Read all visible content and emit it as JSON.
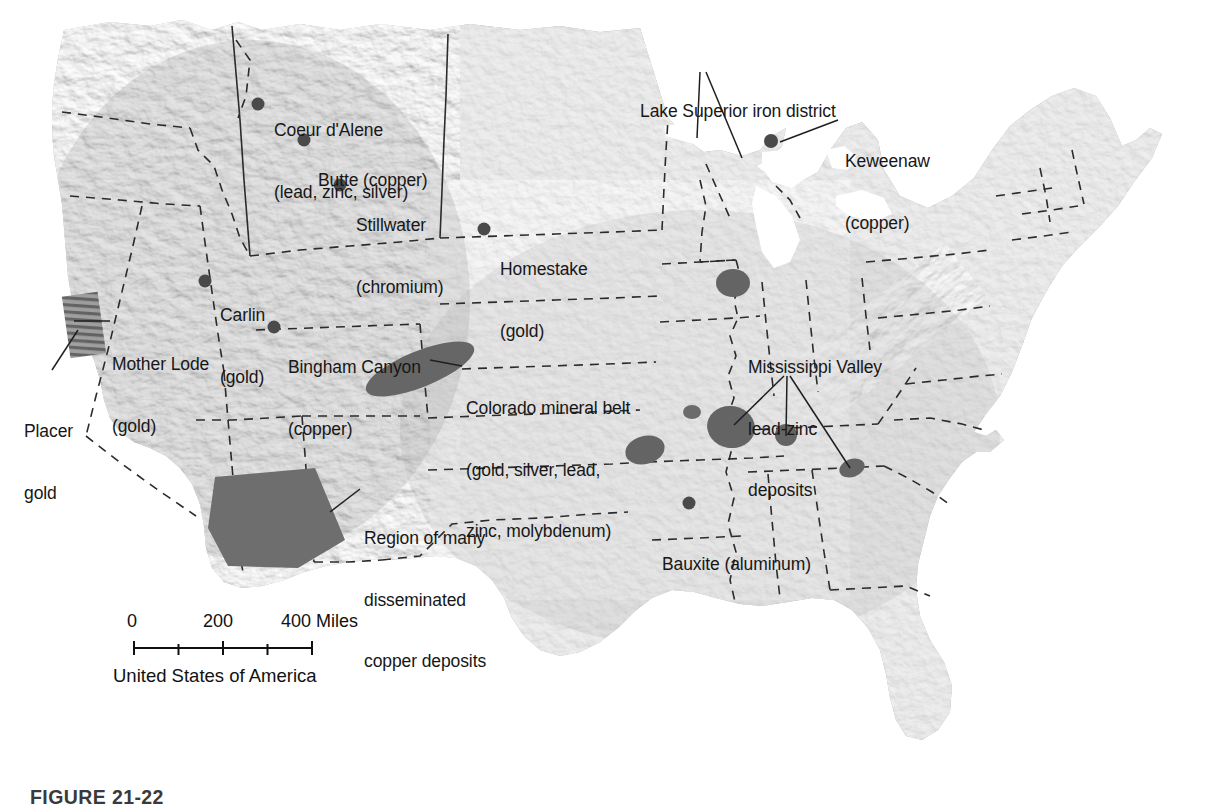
{
  "figure": {
    "caption": "FIGURE 21-22",
    "map_title": "United States of America"
  },
  "colors": {
    "land": "#9b9b9b",
    "land_light": "#b4b4b4",
    "land_dark": "#808080",
    "ore_blob": "#5f5f5f",
    "ore_region": "#6a6a6a",
    "border_dash": "#2b2b2b",
    "text": "#171717",
    "water": "#ffffff",
    "leader": "#1f1f1f"
  },
  "scale_bar": {
    "labels": [
      "0",
      "200",
      "400 Miles"
    ],
    "ticks": [
      0,
      100,
      200,
      300,
      400
    ],
    "unit": "Miles",
    "max_value": 400
  },
  "point_deposits": [
    {
      "name": "Coeur d'Alene",
      "line1": "Coeur d'Alene",
      "line2": "(lead, zinc, silver)",
      "commodity": "lead, zinc, silver",
      "dot": {
        "x": 258,
        "y": 104
      },
      "label": {
        "x": 274,
        "y": 79
      }
    },
    {
      "name": "Butte",
      "line1": "Butte (copper)",
      "line2": "",
      "commodity": "copper",
      "dot": {
        "x": 304,
        "y": 140
      },
      "label": {
        "x": 318,
        "y": 129
      }
    },
    {
      "name": "Stillwater",
      "line1": "Stillwater",
      "line2": "(chromium)",
      "commodity": "chromium",
      "dot": {
        "x": 340,
        "y": 185
      },
      "label": {
        "x": 356,
        "y": 174
      }
    },
    {
      "name": "Homestake",
      "line1": "Homestake",
      "line2": "(gold)",
      "commodity": "gold",
      "dot": {
        "x": 484,
        "y": 229
      },
      "label": {
        "x": 500,
        "y": 218
      }
    },
    {
      "name": "Carlin",
      "line1": "Carlin",
      "line2": "(gold)",
      "commodity": "gold",
      "dot": {
        "x": 205,
        "y": 281
      },
      "label": {
        "x": 220,
        "y": 264
      }
    },
    {
      "name": "Bingham Canyon",
      "line1": "Bingham Canyon",
      "line2": "(copper)",
      "commodity": "copper",
      "dot": {
        "x": 274,
        "y": 327
      },
      "label": {
        "x": 288,
        "y": 316
      }
    },
    {
      "name": "Bauxite",
      "line1": "Bauxite (aluminum)",
      "line2": "",
      "commodity": "aluminum",
      "dot": {
        "x": 689,
        "y": 503
      },
      "label": {
        "x": 662,
        "y": 513
      }
    },
    {
      "name": "Keweenaw",
      "line1": "Keweenaw",
      "line2": "(copper)",
      "commodity": "copper",
      "dot": {
        "x": 771,
        "y": 141
      },
      "label": {
        "x": 845,
        "y": 110
      }
    }
  ],
  "region_labels": [
    {
      "id": "lake-superior",
      "line1": "Lake Superior iron district",
      "line2": "",
      "label": {
        "x": 640,
        "y": 60
      }
    },
    {
      "id": "mother-lode",
      "line1": "Mother Lode",
      "line2": "(gold)",
      "label": {
        "x": 112,
        "y": 313
      }
    },
    {
      "id": "placer-gold",
      "line1": "Placer",
      "line2": "gold",
      "label": {
        "x": 24,
        "y": 380
      }
    },
    {
      "id": "colorado-belt",
      "line1": "Colorado mineral belt",
      "line2": "(gold, silver, lead,",
      "line3": "zinc, molybdenum)",
      "label": {
        "x": 466,
        "y": 357
      }
    },
    {
      "id": "mississippi-valley",
      "line1": "Mississippi Valley",
      "line2": "lead-zinc",
      "line3": "deposits",
      "label": {
        "x": 748,
        "y": 316
      }
    },
    {
      "id": "disseminated-copper",
      "line1": "Region of many",
      "line2": "disseminated",
      "line3": "copper deposits",
      "label": {
        "x": 364,
        "y": 487
      }
    }
  ],
  "ore_bodies": [
    {
      "id": "colorado-mineral-belt",
      "type": "ellipse",
      "cx": 420,
      "cy": 369,
      "rx": 58,
      "ry": 18,
      "rotate": -22
    },
    {
      "id": "disseminated-copper-region",
      "type": "polygon",
      "points": "215,477 315,468 345,540 298,568 228,566 208,528"
    },
    {
      "id": "mississippi-upper-blob",
      "type": "ellipse",
      "cx": 733,
      "cy": 283,
      "rx": 17,
      "ry": 14,
      "rotate": 10
    },
    {
      "id": "tristate-blob",
      "type": "ellipse",
      "cx": 645,
      "cy": 450,
      "rx": 20,
      "ry": 14,
      "rotate": -15
    },
    {
      "id": "small-blob",
      "type": "ellipse",
      "cx": 692,
      "cy": 412,
      "rx": 9,
      "ry": 7,
      "rotate": 0
    },
    {
      "id": "southeast-missouri-blob",
      "type": "ellipse",
      "cx": 731,
      "cy": 427,
      "rx": 24,
      "ry": 21,
      "rotate": 10
    },
    {
      "id": "central-tennessee-blob",
      "type": "ellipse",
      "cx": 786,
      "cy": 435,
      "rx": 11,
      "ry": 11,
      "rotate": 0
    },
    {
      "id": "east-tennessee-blob",
      "type": "ellipse",
      "cx": 852,
      "cy": 468,
      "rx": 13,
      "ry": 9,
      "rotate": -20
    }
  ],
  "hatched_region": {
    "id": "mother-lode-hatch",
    "x": 66,
    "y": 294,
    "w": 36,
    "h": 62
  },
  "leader_lines": [
    {
      "id": "lake-superior-left",
      "path": "M 700,72 L 697,138"
    },
    {
      "id": "lake-superior-right",
      "path": "M 706,72 L 742,158"
    },
    {
      "id": "keweenaw",
      "path": "M 838,120 L 780,142"
    },
    {
      "id": "mother-lode",
      "path": "M 108,321 L 74,321"
    },
    {
      "id": "placer-gold",
      "path": "M 52,370 L 78,330"
    },
    {
      "id": "colorado-belt",
      "path": "M 462,366 L 430,360"
    },
    {
      "id": "mississippi-1",
      "path": "M 784,376 L 734,425"
    },
    {
      "id": "mississippi-2",
      "path": "M 787,376 L 786,436"
    },
    {
      "id": "mississippi-3",
      "path": "M 790,376 L 850,468"
    },
    {
      "id": "disseminated-copper",
      "path": "M 360,489 L 330,512"
    }
  ]
}
